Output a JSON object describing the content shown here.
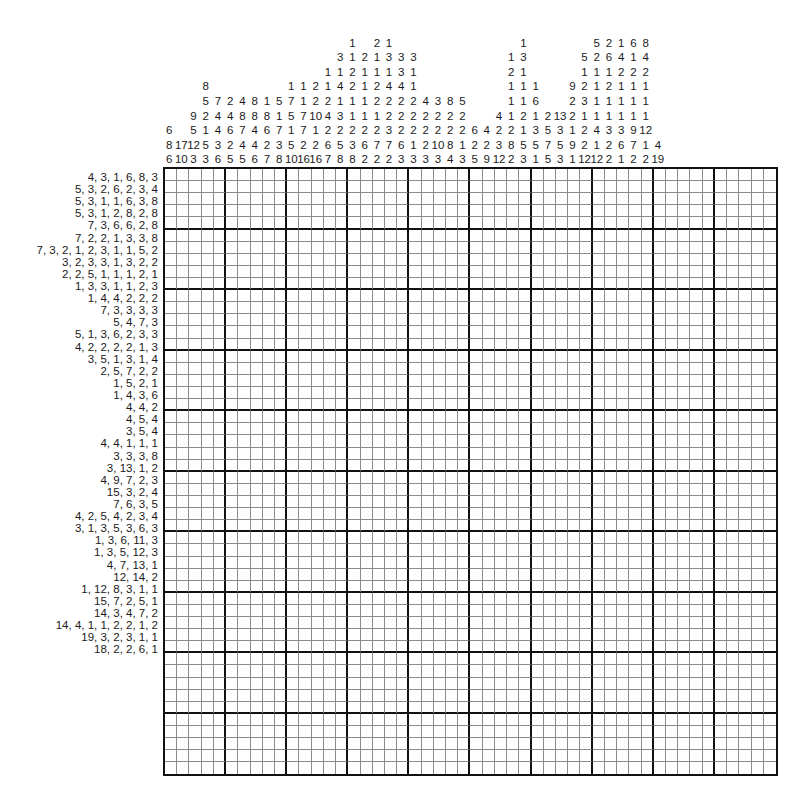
{
  "puzzle": {
    "type": "nonogram",
    "title": "Nonogram Puzzle",
    "grid": {
      "columns": 50,
      "rows": 50,
      "cell_size_px": 12.2,
      "major_line_every": 5,
      "filled_cells": [],
      "grid_line_color": "#8c8c8c",
      "major_line_color": "#111111",
      "background_color": "#ffffff"
    },
    "column_clues": [
      [
        6,
        8,
        6
      ],
      [
        17,
        10
      ],
      [
        9,
        5,
        12,
        3
      ],
      [
        8,
        5,
        2,
        1,
        5,
        3
      ],
      [
        7,
        4,
        4,
        3,
        6
      ],
      [
        2,
        4,
        8,
        4,
        6,
        2,
        5
      ],
      [
        4,
        6,
        8,
        4,
        4,
        5
      ],
      [
        1,
        5,
        7,
        2,
        6
      ],
      [
        5,
        7,
        1,
        7,
        2,
        3,
        7
      ],
      [
        7,
        10,
        7,
        3,
        8
      ],
      [
        10,
        4,
        1,
        7,
        2,
        10
      ],
      [
        4,
        3,
        1,
        7,
        1,
        16
      ],
      [
        1,
        1,
        1,
        2,
        1,
        2,
        16
      ],
      [
        3,
        3,
        1,
        4,
        2,
        1,
        2,
        2,
        7
      ],
      [
        1,
        2,
        2,
        1,
        2,
        1,
        1,
        2,
        5,
        8
      ],
      [
        2,
        1,
        2,
        1,
        1,
        2,
        3,
        8
      ],
      [
        2,
        1,
        1,
        2,
        1,
        2,
        3,
        6,
        2
      ],
      [
        1,
        3,
        1,
        4,
        2,
        3,
        7,
        2
      ],
      [
        3,
        3,
        2,
        2,
        2,
        7,
        3
      ],
      [
        3,
        3,
        1,
        2,
        2,
        6,
        1
      ],
      [
        3,
        1,
        2,
        4,
        2,
        2,
        2,
        2,
        1,
        2
      ],
      [
        4,
        2,
        2,
        2,
        2,
        3
      ],
      [
        4,
        2,
        2,
        10,
        3
      ],
      [
        3,
        2,
        2,
        8,
        3
      ],
      [
        8,
        2,
        8,
        4
      ],
      [
        5,
        2,
        1,
        3
      ],
      [
        6,
        2,
        5
      ],
      [
        4,
        2,
        2,
        9
      ],
      [
        4,
        2,
        3,
        12
      ],
      [
        1,
        1,
        2,
        2,
        8,
        2
      ],
      [
        1,
        2,
        3,
        1,
        2,
        1,
        5,
        3
      ],
      [
        1,
        3,
        1,
        1,
        5,
        1
      ],
      [
        1,
        6,
        1,
        3,
        5,
        5
      ],
      [
        1,
        1,
        5,
        3
      ],
      [
        2,
        2,
        3,
        9,
        1
      ],
      [
        13,
        1,
        2,
        12
      ],
      [
        9,
        2,
        3,
        2,
        1,
        12
      ],
      [
        5,
        1,
        1,
        4,
        2,
        2
      ],
      [
        2,
        1,
        2,
        1,
        1,
        3,
        6,
        1
      ],
      [
        5,
        1,
        1,
        1,
        1,
        1,
        1,
        3,
        7,
        2
      ],
      [
        6,
        4,
        1,
        2,
        1,
        1,
        3,
        1,
        2
      ],
      [
        6,
        2,
        1,
        1,
        1,
        9,
        1,
        2
      ],
      [
        8,
        4,
        2,
        1,
        1,
        12,
        4,
        19
      ]
    ],
    "column_clues_note": "50 columns; clue stacks aligned to bottom of header.",
    "column_clues_grid": [
      [
        "",
        "",
        "",
        "",
        "",
        "",
        "6",
        "8",
        "6"
      ],
      [
        "",
        "",
        "",
        "",
        "",
        "",
        "",
        "17",
        "10"
      ],
      [
        "",
        "",
        "",
        "",
        "",
        "9",
        "5",
        "12",
        "3"
      ],
      [
        "",
        "",
        "",
        "8",
        "5",
        "2",
        "1",
        "5",
        "3"
      ],
      [
        "",
        "",
        "",
        "",
        "7",
        "4",
        "4",
        "3",
        "6"
      ],
      [
        "",
        "",
        "",
        "",
        "2",
        "4",
        "6",
        "2",
        "5"
      ],
      [
        "",
        "",
        "",
        "",
        "4",
        "8",
        "7",
        "4",
        "5"
      ],
      [
        "",
        "",
        "",
        "",
        "8",
        "8",
        "4",
        "4",
        "6"
      ],
      [
        "",
        "",
        "",
        "",
        "1",
        "8",
        "6",
        "2",
        "7"
      ],
      [
        "",
        "",
        "",
        "",
        "5",
        "1",
        "7",
        "3",
        "8"
      ],
      [
        "",
        "",
        "",
        "1",
        "7",
        "5",
        "1",
        "5",
        "10"
      ],
      [
        "",
        "",
        "",
        "1",
        "1",
        "7",
        "7",
        "2",
        "16"
      ],
      [
        "",
        "",
        "",
        "2",
        "2",
        "10",
        "1",
        "2",
        "16"
      ],
      [
        "",
        "",
        "1",
        "1",
        "2",
        "4",
        "2",
        "6",
        "7"
      ],
      [
        "",
        "3",
        "1",
        "4",
        "1",
        "3",
        "2",
        "5",
        "8"
      ],
      [
        "1",
        "1",
        "2",
        "2",
        "1",
        "1",
        "2",
        "3",
        "8"
      ],
      [
        "",
        "2",
        "1",
        "1",
        "1",
        "1",
        "2",
        "6",
        "2"
      ],
      [
        "2",
        "1",
        "1",
        "2",
        "2",
        "1",
        "2",
        "7",
        "2"
      ],
      [
        "1",
        "3",
        "1",
        "4",
        "2",
        "2",
        "3",
        "7",
        "2"
      ],
      [
        "",
        "3",
        "3",
        "4",
        "2",
        "2",
        "2",
        "6",
        "3"
      ],
      [
        "",
        "3",
        "1",
        "1",
        "2",
        "2",
        "2",
        "1",
        "3"
      ],
      [
        "",
        "",
        "",
        "",
        "4",
        "2",
        "2",
        "2",
        "3"
      ],
      [
        "",
        "",
        "",
        "",
        "3",
        "2",
        "2",
        "10",
        "3"
      ],
      [
        "",
        "",
        "",
        "",
        "8",
        "2",
        "2",
        "8",
        "4"
      ],
      [
        "",
        "",
        "",
        "",
        "5",
        "2",
        "2",
        "1",
        "3"
      ],
      [
        "",
        "",
        "",
        "",
        "",
        "",
        "6",
        "2",
        "5"
      ],
      [
        "",
        "",
        "",
        "",
        "",
        "",
        "4",
        "2",
        "9"
      ],
      [
        "",
        "",
        "",
        "",
        "",
        "4",
        "2",
        "3",
        "12"
      ],
      [
        "",
        "1",
        "2",
        "1",
        "1",
        "1",
        "2",
        "8",
        "2"
      ],
      [
        "1",
        "3",
        "1",
        "1",
        "1",
        "2",
        "1",
        "5",
        "3"
      ],
      [
        "",
        "",
        "",
        "1",
        "6",
        "1",
        "3",
        "5",
        "1"
      ],
      [
        "",
        "",
        "",
        "",
        "",
        "2",
        "5",
        "7",
        "5"
      ],
      [
        "",
        "",
        "",
        "",
        "",
        "13",
        "3",
        "5",
        "3"
      ],
      [
        "",
        "",
        "",
        "9",
        "2",
        "2",
        "1",
        "9",
        "1"
      ],
      [
        "",
        "5",
        "1",
        "2",
        "3",
        "1",
        "2",
        "2",
        "12"
      ],
      [
        "5",
        "2",
        "1",
        "1",
        "1",
        "1",
        "4",
        "1",
        "12"
      ],
      [
        "2",
        "6",
        "1",
        "2",
        "1",
        "1",
        "3",
        "2",
        "2"
      ],
      [
        "1",
        "4",
        "2",
        "1",
        "1",
        "1",
        "3",
        "6",
        "1"
      ],
      [
        "6",
        "1",
        "2",
        "1",
        "1",
        "1",
        "9",
        "7",
        "2"
      ],
      [
        "8",
        "4",
        "2",
        "1",
        "1",
        "1",
        "12",
        "1",
        "2"
      ],
      [
        "",
        "",
        "",
        "",
        "",
        "",
        "",
        "4",
        "19"
      ]
    ],
    "row_clues": [
      "4, 3, 1, 6, 8, 3",
      "5, 3, 2, 6, 2, 3, 4",
      "5, 3, 1, 1, 6, 3, 8",
      "5, 3, 1, 2, 8, 2, 8",
      "7, 3, 6, 6, 2, 8",
      "7, 2, 2, 1, 3, 3, 8",
      "7, 3, 2, 1, 2, 3, 1, 1, 5, 2",
      "3, 2, 3, 3, 1, 3, 2, 2",
      "2, 2, 5, 1, 1, 1, 2, 1",
      "1, 3, 3, 1, 1, 2, 3",
      "1, 4, 4, 2, 2, 2",
      "7, 3, 3, 3, 3",
      "5, 4, 7, 3",
      "5, 1, 3, 6, 2, 3, 3",
      "4, 2, 2, 2, 2, 1, 3",
      "3, 5, 1, 3, 1, 4",
      "2, 5, 7, 2, 2",
      "1, 5, 2, 1",
      "1, 4, 3, 6",
      "4, 4, 2",
      "4, 5, 4",
      "3, 5, 4",
      "4, 4, 1, 1, 1",
      "3, 3, 3, 8",
      "3, 13, 1, 2",
      "4, 9, 7, 2, 3",
      "15, 3, 2, 4",
      "7, 6, 3, 5",
      "4, 2, 5, 4, 2, 3, 4",
      "3, 1, 3, 5, 3, 6, 3",
      "1, 3, 6, 11, 3",
      "1, 3, 5, 12, 3",
      "4, 7, 13, 1",
      "12, 14, 2",
      "1, 12, 8, 3, 1, 1",
      "15, 7, 2, 5, 1",
      "14, 3, 4, 7, 2",
      "14, 4, 1, 1, 2, 2, 1, 2",
      "19, 3, 2, 3, 1, 1",
      "18, 2, 2, 6, 1"
    ]
  }
}
